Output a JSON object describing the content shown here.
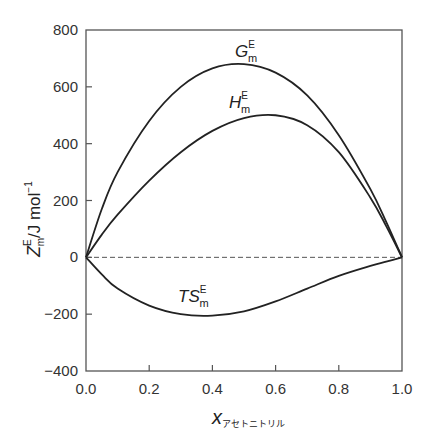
{
  "chart_data": {
    "type": "line",
    "title": "",
    "xlabel": "x_アセトニトリル",
    "xlabel_main": "x",
    "xlabel_sub": "アセトニトリル",
    "ylabel": "Z^E_m / J mol^-1",
    "ylabel_parts": {
      "main": "Z",
      "sup": "E",
      "sub": "m",
      "unit": "/J mol",
      "unit_sup": "−1"
    },
    "xlim": [
      0.0,
      1.0
    ],
    "ylim": [
      -400,
      800
    ],
    "x_ticks": [
      "0.0",
      "0.2",
      "0.4",
      "0.6",
      "0.8",
      "1.0"
    ],
    "y_ticks": [
      "800",
      "600",
      "400",
      "200",
      "0",
      "−200",
      "−400"
    ],
    "grid": false,
    "reference_line": {
      "y": 0,
      "style": "dashed"
    },
    "x": [
      0.0,
      0.05,
      0.1,
      0.2,
      0.3,
      0.4,
      0.5,
      0.6,
      0.7,
      0.8,
      0.9,
      0.95,
      1.0
    ],
    "series": [
      {
        "name": "G^E_m",
        "label_main": "G",
        "label_sup": "E",
        "label_sub": "m",
        "values": [
          0,
          170,
          300,
          480,
          600,
          665,
          680,
          650,
          570,
          430,
          240,
          125,
          0
        ]
      },
      {
        "name": "H^E_m",
        "label_main": "H",
        "label_sup": "E",
        "label_sub": "m",
        "values": [
          0,
          80,
          150,
          270,
          370,
          445,
          490,
          500,
          465,
          370,
          210,
          110,
          0
        ]
      },
      {
        "name": "TS^E_m",
        "label_main": "TS",
        "label_sup": "E",
        "label_sub": "m",
        "values": [
          0,
          -60,
          -110,
          -170,
          -200,
          -205,
          -190,
          -155,
          -110,
          -65,
          -30,
          -15,
          0
        ]
      }
    ]
  }
}
